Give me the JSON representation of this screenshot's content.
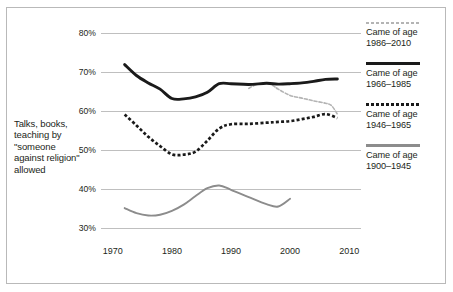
{
  "chart_data": {
    "type": "line",
    "title": "",
    "xlabel": "",
    "ylabel": "Talks, books, teaching by \"someone against religion\" allowed",
    "xlim": [
      1968,
      2012
    ],
    "ylim": [
      30,
      80
    ],
    "grid": true,
    "legend_position": "right",
    "y_ticks": [
      "30%",
      "40%",
      "50%",
      "60%",
      "70%",
      "80%"
    ],
    "y_tick_values": [
      30,
      40,
      50,
      60,
      70,
      80
    ],
    "x_ticks": [
      "1970",
      "1980",
      "1990",
      "2000",
      "2010"
    ],
    "x_tick_values": [
      1970,
      1980,
      1990,
      2000,
      2010
    ],
    "series": [
      {
        "name": "Came of age 1986-2010",
        "style": "dashed-light",
        "color": "#b4b4b4",
        "x": [
          1993,
          1994,
          1995,
          1996,
          1997,
          1998,
          2000,
          2002,
          2004,
          2006,
          2007,
          2008
        ],
        "values": [
          65.8,
          66.6,
          67.0,
          67.1,
          66.6,
          65.6,
          64.0,
          63.3,
          62.6,
          62.0,
          61.4,
          59.2
        ]
      },
      {
        "name": "Came of age 1966-1985",
        "style": "solid-black",
        "color": "#1a1a1a",
        "x": [
          1972,
          1974,
          1976,
          1978,
          1980,
          1982,
          1984,
          1986,
          1988,
          1990,
          1993,
          1996,
          1998,
          2000,
          2002,
          2004,
          2006,
          2008
        ],
        "values": [
          71.9,
          69.1,
          67.2,
          65.6,
          63.2,
          63.1,
          63.6,
          64.8,
          67.0,
          67.0,
          66.8,
          67.1,
          66.9,
          67.0,
          67.2,
          67.6,
          68.1,
          68.2
        ]
      },
      {
        "name": "Came of age 1946-1965",
        "style": "dotted-black",
        "color": "#1a1a1a",
        "x": [
          1972,
          1974,
          1976,
          1978,
          1980,
          1982,
          1984,
          1986,
          1988,
          1990,
          1993,
          1996,
          1998,
          2000,
          2002,
          2004,
          2006,
          2008
        ],
        "values": [
          59.1,
          56.3,
          53.4,
          51.0,
          48.9,
          48.8,
          49.6,
          52.4,
          55.5,
          56.6,
          56.7,
          57.0,
          57.2,
          57.4,
          57.9,
          58.5,
          59.2,
          58.2
        ]
      },
      {
        "name": "Came of age 1900-1945",
        "style": "solid-gray",
        "color": "#8c8c8c",
        "x": [
          1972,
          1974,
          1976,
          1978,
          1980,
          1982,
          1984,
          1986,
          1988,
          1990,
          1993,
          1996,
          1998,
          2000
        ],
        "values": [
          35.1,
          33.8,
          33.2,
          33.4,
          34.4,
          36.0,
          38.2,
          40.2,
          40.9,
          39.8,
          37.9,
          36.1,
          35.5,
          37.5
        ]
      }
    ]
  },
  "axis": {
    "y_description": "Talks, books, teaching by \"someone against religion\" allowed"
  },
  "legend": {
    "entries": [
      {
        "swatch": "dashed-light-line-icon",
        "label": "Came of age\n1986–2010",
        "line1": "Came of age",
        "line2": "1986–2010"
      },
      {
        "swatch": "solid-black-line-icon",
        "label": "Came of age\n1966–1985",
        "line1": "Came of age",
        "line2": "1966–1985"
      },
      {
        "swatch": "dotted-black-line-icon",
        "label": "Came of age\n1946–1965",
        "line1": "Came of age",
        "line2": "1946–1965"
      },
      {
        "swatch": "solid-gray-line-icon",
        "label": "Came of age\n1900–1945",
        "line1": "Came of age",
        "line2": "1900–1945"
      }
    ]
  }
}
